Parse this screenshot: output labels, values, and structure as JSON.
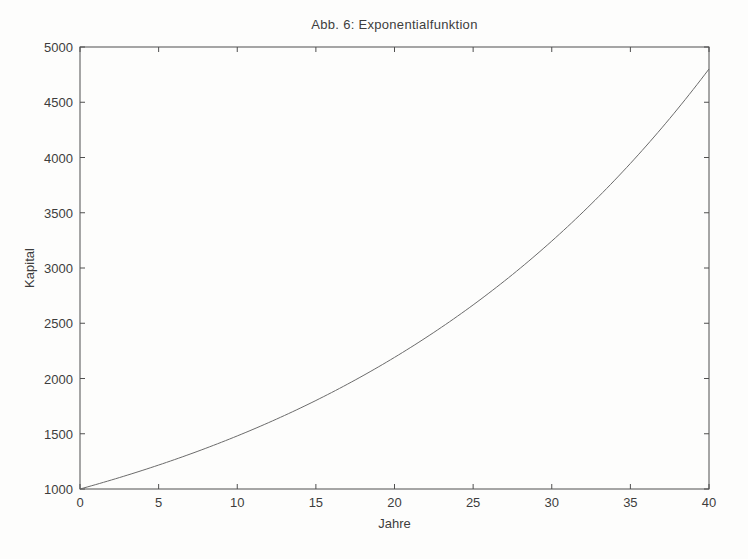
{
  "figure": {
    "background_color": "#fdfdfc",
    "text_color": "#3d3d3d",
    "axis_color": "#4f4f4f"
  },
  "chart_data": {
    "type": "line",
    "title": "Abb. 6: Exponentialfunktion",
    "xlabel": "Jahre",
    "ylabel": "Kapital",
    "xlim": [
      0,
      40
    ],
    "ylim": [
      1000,
      5000
    ],
    "x_ticks": [
      0,
      5,
      10,
      15,
      20,
      25,
      30,
      35,
      40
    ],
    "y_ticks": [
      1000,
      1500,
      2000,
      2500,
      3000,
      3500,
      4000,
      4500,
      5000
    ],
    "grid": false,
    "legend": "none",
    "box": true,
    "line_color": "#6b6b6b",
    "line_width": 1,
    "model": {
      "formula": "K(t) = 1000 * 1.04^t",
      "initial": 1000,
      "growth_factor": 1.04
    },
    "series": [
      {
        "name": "Kapital",
        "x": [
          0,
          5,
          10,
          15,
          20,
          25,
          30,
          35,
          40
        ],
        "values": [
          1000,
          1217,
          1480,
          1801,
          2191,
          2666,
          3243,
          3946,
          4801
        ]
      }
    ]
  }
}
